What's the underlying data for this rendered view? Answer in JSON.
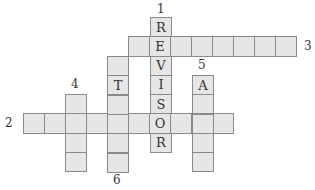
{
  "puzzle": {
    "type": "crossword",
    "cell_size": 21,
    "colors": {
      "cell_fill": "#e6e6e6",
      "cell_border": "#8a8a8a",
      "text": "#333333"
    },
    "words": [
      {
        "number": "1",
        "direction": "down",
        "x": 150,
        "y": 17,
        "length": 7,
        "letters": [
          "R",
          "E",
          "V",
          "I",
          "S",
          "O",
          "R"
        ],
        "label_x": 157,
        "label_y": 3
      },
      {
        "number": "2",
        "direction": "across",
        "x": 23,
        "y": 113,
        "length": 10,
        "letters": [
          "",
          "",
          "",
          "",
          "",
          "",
          "O",
          "",
          "",
          ""
        ],
        "label_x": 5,
        "label_y": 117
      },
      {
        "number": "3",
        "direction": "across",
        "x": 128,
        "y": 36,
        "length": 8,
        "letters": [
          "",
          "E",
          "",
          "",
          "",
          "",
          "",
          ""
        ],
        "label_x": 304,
        "label_y": 40
      },
      {
        "number": "4",
        "direction": "down",
        "x": 65,
        "y": 94,
        "length": 4,
        "letters": [
          "",
          "",
          "",
          ""
        ],
        "label_x": 71,
        "label_y": 78
      },
      {
        "number": "5",
        "direction": "down",
        "x": 192,
        "y": 75,
        "length": 5,
        "letters": [
          "A",
          "",
          "",
          "",
          ""
        ],
        "label_x": 198,
        "label_y": 59
      },
      {
        "number": "6",
        "direction": "down",
        "x": 107,
        "y": 56,
        "length": 6,
        "letters": [
          "",
          "T",
          "",
          "",
          "",
          ""
        ],
        "label_x": 113,
        "label_y": 174
      }
    ]
  }
}
